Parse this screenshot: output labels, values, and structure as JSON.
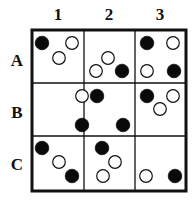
{
  "columns": [
    "1",
    "2",
    "3"
  ],
  "rows": [
    "A",
    "B",
    "C"
  ],
  "colors": {
    "black": "#0a0a0a",
    "white": "#ffffff",
    "line": "#111111"
  },
  "grid": {
    "x0": 32,
    "y0": 30,
    "x1": 186,
    "y1": 191,
    "vlines": [
      84,
      135
    ],
    "hlines": [
      83,
      136
    ]
  },
  "circles": [
    {
      "cell": "A1",
      "fill": "black",
      "cx": 42,
      "cy": 43
    },
    {
      "cell": "A1",
      "fill": "white",
      "cx": 72,
      "cy": 43
    },
    {
      "cell": "A1",
      "fill": "white",
      "cx": 59,
      "cy": 58
    },
    {
      "cell": "A2",
      "fill": "white",
      "cx": 108,
      "cy": 58
    },
    {
      "cell": "A2",
      "fill": "white",
      "cx": 96,
      "cy": 71
    },
    {
      "cell": "A2",
      "fill": "black",
      "cx": 122,
      "cy": 71
    },
    {
      "cell": "A3",
      "fill": "black",
      "cx": 147,
      "cy": 43
    },
    {
      "cell": "A3",
      "fill": "white",
      "cx": 173,
      "cy": 43
    },
    {
      "cell": "A3",
      "fill": "white",
      "cx": 147,
      "cy": 71
    },
    {
      "cell": "A3",
      "fill": "black",
      "cx": 174,
      "cy": 71
    },
    {
      "cell": "B1",
      "fill": "white",
      "cx": 82,
      "cy": 96
    },
    {
      "cell": "B2",
      "fill": "black",
      "cx": 97,
      "cy": 96
    },
    {
      "cell": "B1",
      "fill": "black",
      "cx": 82,
      "cy": 125
    },
    {
      "cell": "B2",
      "fill": "black",
      "cx": 123,
      "cy": 125
    },
    {
      "cell": "B3",
      "fill": "black",
      "cx": 147,
      "cy": 96
    },
    {
      "cell": "B3",
      "fill": "white",
      "cx": 173,
      "cy": 96
    },
    {
      "cell": "B3",
      "fill": "white",
      "cx": 160,
      "cy": 109
    },
    {
      "cell": "C1",
      "fill": "black",
      "cx": 42,
      "cy": 148
    },
    {
      "cell": "C1",
      "fill": "white",
      "cx": 59,
      "cy": 162
    },
    {
      "cell": "C1",
      "fill": "black",
      "cx": 72,
      "cy": 176
    },
    {
      "cell": "C2",
      "fill": "black",
      "cx": 102,
      "cy": 148
    },
    {
      "cell": "C2",
      "fill": "white",
      "cx": 115,
      "cy": 162
    },
    {
      "cell": "C2",
      "fill": "white",
      "cx": 103,
      "cy": 176
    },
    {
      "cell": "C3",
      "fill": "white",
      "cx": 146,
      "cy": 176
    },
    {
      "cell": "C3",
      "fill": "black",
      "cx": 175,
      "cy": 176
    }
  ]
}
